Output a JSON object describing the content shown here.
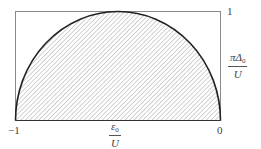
{
  "diagram": {
    "type": "semicircle-region",
    "x_axis": {
      "label_numerator": "ε",
      "label_numerator_sub": "0",
      "label_denominator": "U",
      "ticks": [
        {
          "value": "−1",
          "position": "left"
        },
        {
          "value": "0",
          "position": "right"
        }
      ]
    },
    "y_axis": {
      "label_numerator": "πΔ",
      "label_numerator_sub": "0",
      "label_denominator": "U",
      "ticks": [
        {
          "value": "1",
          "position": "top"
        }
      ]
    },
    "colors": {
      "frame": "#8a8a8a",
      "curve": "#222222",
      "hatch": "#9a9a9a",
      "background": "#ffffff"
    }
  }
}
